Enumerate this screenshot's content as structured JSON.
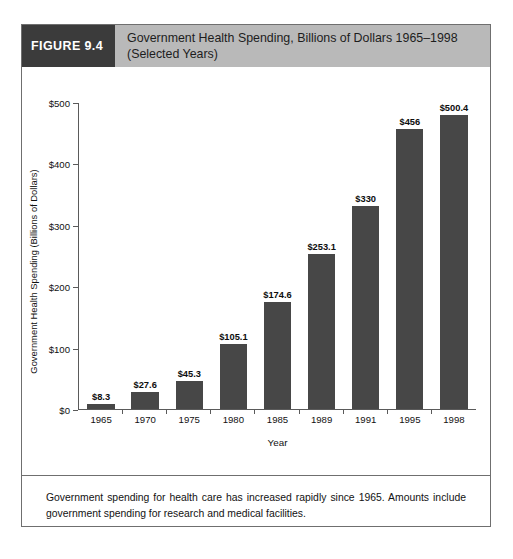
{
  "figure": {
    "number_label": "FIGURE 9.4",
    "title_line1": "Government Health Spending, Billions of Dollars 1965–1998",
    "title_line2": "(Selected Years)",
    "caption": "Government spending for health care has increased rapidly since 1965. Amounts include government spending for research and medical facilities."
  },
  "colors": {
    "figure_number_bg": "#3b3b3b",
    "figure_title_bg": "#b9b9b9",
    "bar_fill": "#474747",
    "axis_line": "#5a5a5a",
    "border": "#6f6f6f"
  },
  "chart_data": {
    "type": "bar",
    "title": "Government Health Spending, Billions of Dollars 1965–1998 (Selected Years)",
    "xlabel": "Year",
    "ylabel": "Government Health Spending (Billions of Dollars)",
    "categories": [
      "1965",
      "1970",
      "1975",
      "1980",
      "1985",
      "1989",
      "1991",
      "1995",
      "1998"
    ],
    "values": [
      8.3,
      27.6,
      45.3,
      105.1,
      174.6,
      253.1,
      330,
      456,
      500.4
    ],
    "value_labels": [
      "$8.3",
      "$27.6",
      "$45.3",
      "$105.1",
      "$174.6",
      "$253.1",
      "$330",
      "$456",
      "$500.4"
    ],
    "ylim": [
      0,
      500
    ],
    "ytick_values": [
      0,
      100,
      200,
      300,
      400,
      500
    ],
    "ytick_labels": [
      "$0",
      "$100",
      "$200",
      "$300",
      "$400",
      "$500"
    ],
    "grid": false,
    "legend": null,
    "bar_color": "#474747"
  }
}
